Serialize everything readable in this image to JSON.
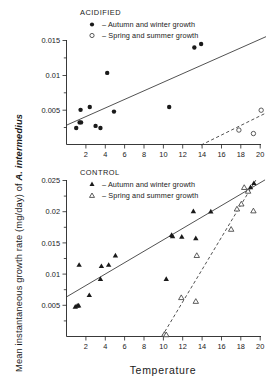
{
  "figure": {
    "ylabel_prefix": "Mean instantaneous growth rate (mg/day) of ",
    "ylabel_species": "A. intermedius",
    "xlabel": "Temperature"
  },
  "chart_data": [
    {
      "type": "scatter",
      "title": "ACIDIFIED",
      "panel": "top",
      "xlabel": "Temperature",
      "ylabel": "Mean instantaneous growth rate (mg/day) of A. intermedius",
      "xlim": [
        0,
        20.8
      ],
      "ylim": [
        0,
        0.0165
      ],
      "xticks": [
        2,
        4,
        6,
        8,
        10,
        12,
        14,
        16,
        18,
        20
      ],
      "xticklabels": [
        "2",
        "4",
        "6",
        "8",
        "10",
        "12",
        "14",
        "16",
        "18",
        "20"
      ],
      "yticks": [
        0.005,
        0.01,
        0.015
      ],
      "yticklabels": [
        "0.005",
        "0.01",
        "0.015"
      ],
      "yminorticks": [
        0.0025,
        0.0075,
        0.0125
      ],
      "grid": false,
      "legend_position": "top-center",
      "series": [
        {
          "name": "Autumn and winter growth",
          "marker": "filled-circle",
          "legend_label": "–  Autumn and winter growth",
          "points": [
            {
              "x": 1.0,
              "y": 0.00245
            },
            {
              "x": 1.35,
              "y": 0.00325
            },
            {
              "x": 1.5,
              "y": 0.00325
            },
            {
              "x": 1.45,
              "y": 0.00505
            },
            {
              "x": 2.4,
              "y": 0.00545
            },
            {
              "x": 3.0,
              "y": 0.00275
            },
            {
              "x": 3.5,
              "y": 0.00245
            },
            {
              "x": 4.2,
              "y": 0.01035
            },
            {
              "x": 4.9,
              "y": 0.0048
            },
            {
              "x": 10.6,
              "y": 0.00545
            },
            {
              "x": 13.2,
              "y": 0.014
            },
            {
              "x": 13.9,
              "y": 0.0145
            }
          ],
          "fit": {
            "style": "solid",
            "x0": 0.0,
            "y0": 0.00285,
            "x1": 20.6,
            "y1": 0.01555
          }
        },
        {
          "name": "Spring and summer growth",
          "marker": "open-circle",
          "legend_label": "–  Spring and summer growth",
          "points": [
            {
              "x": 17.8,
              "y": 0.00215
            },
            {
              "x": 19.3,
              "y": 0.00165
            },
            {
              "x": 20.1,
              "y": 0.005
            }
          ],
          "fit": {
            "style": "dashed",
            "x0": 13.9,
            "y0": 0.0,
            "x1": 20.6,
            "y1": 0.0046
          }
        }
      ]
    },
    {
      "type": "scatter",
      "title": "CONTROL",
      "panel": "bottom",
      "xlabel": "Temperature",
      "ylabel": "Mean instantaneous growth rate (mg/day) of A. intermedius",
      "xlim": [
        0,
        20.8
      ],
      "ylim": [
        0,
        0.0268
      ],
      "xticks": [
        2,
        4,
        6,
        8,
        10,
        12,
        14,
        16,
        18,
        20
      ],
      "xticklabels": [
        "2",
        "4",
        "6",
        "8",
        "10",
        "12",
        "14",
        "16",
        "18",
        "20"
      ],
      "yticks": [
        0.005,
        0.01,
        0.015,
        0.02,
        0.025
      ],
      "yticklabels": [
        "0.005",
        "0.01",
        "0.015",
        "0.02",
        "0.025"
      ],
      "yminorticks": [
        0.0025,
        0.0075,
        0.0125,
        0.0175,
        0.0225
      ],
      "grid": false,
      "legend_position": "top-center",
      "series": [
        {
          "name": "Autumn and winter growth",
          "marker": "filled-triangle",
          "legend_label": "–  Autumn and winter growth",
          "points": [
            {
              "x": 0.9,
              "y": 0.0048
            },
            {
              "x": 1.1,
              "y": 0.00495
            },
            {
              "x": 1.25,
              "y": 0.005
            },
            {
              "x": 1.3,
              "y": 0.0115
            },
            {
              "x": 2.35,
              "y": 0.00665
            },
            {
              "x": 3.5,
              "y": 0.00925
            },
            {
              "x": 3.6,
              "y": 0.0113
            },
            {
              "x": 4.35,
              "y": 0.0115
            },
            {
              "x": 5.05,
              "y": 0.013
            },
            {
              "x": 10.3,
              "y": 0.00925
            },
            {
              "x": 10.85,
              "y": 0.0163
            },
            {
              "x": 10.95,
              "y": 0.0161
            },
            {
              "x": 11.9,
              "y": 0.016
            },
            {
              "x": 13.1,
              "y": 0.0201
            },
            {
              "x": 13.35,
              "y": 0.01575
            },
            {
              "x": 14.9,
              "y": 0.02005
            },
            {
              "x": 19.0,
              "y": 0.02395
            },
            {
              "x": 19.35,
              "y": 0.0246
            }
          ],
          "fit": {
            "style": "solid",
            "x0": 0.0,
            "y0": 0.00635,
            "x1": 20.5,
            "y1": 0.0251
          }
        },
        {
          "name": "Spring and summer growth",
          "marker": "open-triangle",
          "legend_label": "–  Spring and summer growth",
          "points": [
            {
              "x": 10.1,
              "y": 0.00035
            },
            {
              "x": 10.3,
              "y": 0.0003
            },
            {
              "x": 11.85,
              "y": 0.00625
            },
            {
              "x": 13.35,
              "y": 0.00565
            },
            {
              "x": 13.45,
              "y": 0.013
            },
            {
              "x": 17.0,
              "y": 0.0172
            },
            {
              "x": 17.6,
              "y": 0.02045
            },
            {
              "x": 18.05,
              "y": 0.02125
            },
            {
              "x": 18.35,
              "y": 0.0239
            },
            {
              "x": 18.75,
              "y": 0.0233
            },
            {
              "x": 19.3,
              "y": 0.02015
            }
          ],
          "fit": {
            "style": "dashed",
            "x0": 9.85,
            "y0": 0.0,
            "x1": 19.6,
            "y1": 0.0252
          }
        }
      ]
    }
  ]
}
